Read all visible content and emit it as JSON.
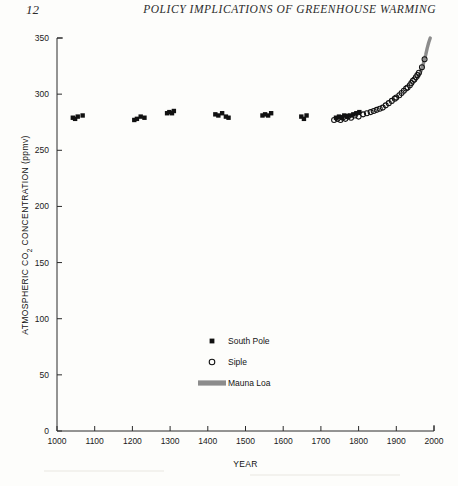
{
  "page": {
    "folio": "12",
    "running_head": "POLICY IMPLICATIONS OF GREENHOUSE WARMING"
  },
  "chart_data": {
    "type": "scatter",
    "title": "",
    "xlabel": "YEAR",
    "ylabel": "ATMOSPHERIC CO₂ CONCENTRATION (ppmv)",
    "ylabel_main": "ATMOSPHERIC CO",
    "ylabel_sub": "2",
    "ylabel_tail": " CONCENTRATION (ppmv)",
    "xlim": [
      1000,
      2000
    ],
    "ylim": [
      0,
      350
    ],
    "xticks": [
      1000,
      1100,
      1200,
      1300,
      1400,
      1500,
      1600,
      1700,
      1800,
      1900,
      2000
    ],
    "yticks": [
      0,
      50,
      100,
      150,
      200,
      250,
      300,
      350
    ],
    "grid": false,
    "legend_position": "center-lower",
    "series": [
      {
        "name": "South Pole",
        "marker": "filled-square",
        "color": "#111111",
        "points": [
          [
            1042,
            279
          ],
          [
            1048,
            278
          ],
          [
            1055,
            280
          ],
          [
            1068,
            281
          ],
          [
            1205,
            277
          ],
          [
            1212,
            278
          ],
          [
            1222,
            280
          ],
          [
            1232,
            279
          ],
          [
            1292,
            283
          ],
          [
            1298,
            284
          ],
          [
            1305,
            283
          ],
          [
            1310,
            285
          ],
          [
            1420,
            282
          ],
          [
            1428,
            281
          ],
          [
            1438,
            283
          ],
          [
            1448,
            280
          ],
          [
            1455,
            279
          ],
          [
            1545,
            281
          ],
          [
            1552,
            282
          ],
          [
            1560,
            281
          ],
          [
            1568,
            283
          ],
          [
            1648,
            280
          ],
          [
            1655,
            278
          ],
          [
            1662,
            281
          ],
          [
            1740,
            279
          ],
          [
            1748,
            280
          ],
          [
            1756,
            279
          ],
          [
            1762,
            281
          ],
          [
            1770,
            280
          ],
          [
            1778,
            281
          ],
          [
            1786,
            282
          ],
          [
            1794,
            283
          ],
          [
            1802,
            284
          ]
        ]
      },
      {
        "name": "Siple",
        "marker": "open-circle",
        "color": "#111111",
        "points": [
          [
            1735,
            277
          ],
          [
            1744,
            278
          ],
          [
            1752,
            277
          ],
          [
            1758,
            279
          ],
          [
            1765,
            278
          ],
          [
            1772,
            280
          ],
          [
            1780,
            279
          ],
          [
            1790,
            281
          ],
          [
            1800,
            280
          ],
          [
            1812,
            282
          ],
          [
            1822,
            283
          ],
          [
            1832,
            284
          ],
          [
            1840,
            285
          ],
          [
            1848,
            286
          ],
          [
            1856,
            287
          ],
          [
            1864,
            288
          ],
          [
            1872,
            290
          ],
          [
            1880,
            292
          ],
          [
            1888,
            294
          ],
          [
            1896,
            296
          ],
          [
            1900,
            297
          ],
          [
            1908,
            299
          ],
          [
            1914,
            301
          ],
          [
            1920,
            303
          ],
          [
            1926,
            305
          ],
          [
            1930,
            306
          ],
          [
            1936,
            308
          ],
          [
            1940,
            310
          ],
          [
            1944,
            312
          ],
          [
            1948,
            313
          ],
          [
            1952,
            315
          ],
          [
            1956,
            317
          ],
          [
            1960,
            319
          ],
          [
            1968,
            324
          ],
          [
            1975,
            331
          ]
        ]
      },
      {
        "name": "Mauna Loa",
        "marker": "thick-line",
        "color": "#8c8c8c",
        "points": [
          [
            1958,
            315
          ],
          [
            1962,
            318
          ],
          [
            1966,
            321
          ],
          [
            1970,
            325
          ],
          [
            1974,
            330
          ],
          [
            1978,
            335
          ],
          [
            1982,
            341
          ],
          [
            1986,
            346
          ],
          [
            1990,
            350
          ]
        ]
      }
    ]
  },
  "legend": {
    "items": [
      {
        "label": "South Pole",
        "marker": "filled-square"
      },
      {
        "label": "Siple",
        "marker": "open-circle"
      },
      {
        "label": "Mauna Loa",
        "marker": "thick-line"
      }
    ]
  }
}
